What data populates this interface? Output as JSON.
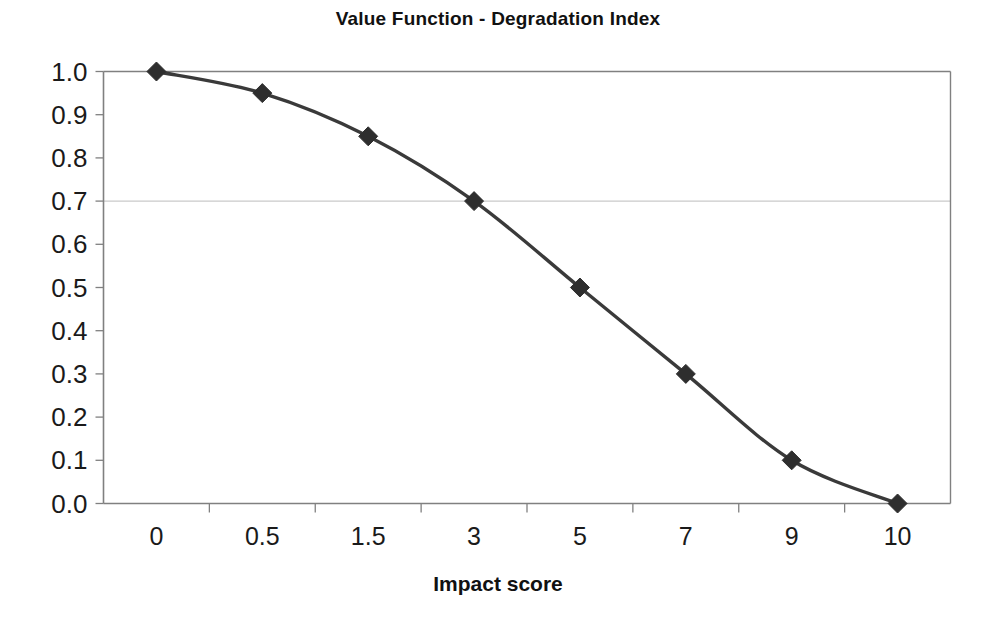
{
  "chart_data": {
    "type": "line",
    "title": "Value Function - Degradation Index",
    "xlabel": "Impact score",
    "ylabel": "",
    "categories": [
      "0",
      "0.5",
      "1.5",
      "3",
      "5",
      "7",
      "9",
      "10"
    ],
    "values": [
      1.0,
      0.95,
      0.85,
      0.7,
      0.5,
      0.3,
      0.1,
      0.0
    ],
    "series": [
      {
        "name": "Degradation Index",
        "values": [
          1.0,
          0.95,
          0.85,
          0.7,
          0.5,
          0.3,
          0.1,
          0.0
        ]
      }
    ],
    "ylim": [
      0.0,
      1.0
    ],
    "ytick_labels": [
      "1.0",
      "0.9",
      "0.8",
      "0.7",
      "0.6",
      "0.5",
      "0.4",
      "0.3",
      "0.2",
      "0.1",
      "0.0"
    ],
    "ytick_values": [
      1.0,
      0.9,
      0.8,
      0.7,
      0.6,
      0.5,
      0.4,
      0.3,
      0.2,
      0.1,
      0.0
    ],
    "grid": {
      "horizontal_gridlines_at": [
        0.7
      ],
      "vertical": false,
      "color": "#b9b9b9"
    },
    "legend": null,
    "marker": "diamond",
    "smoothed": true,
    "colors": {
      "line": "#3a3a3a",
      "marker": "#2e2e2e",
      "axis": "#808080",
      "gridline": "#bdbdbd",
      "text": "#1a1a1a",
      "background": "#ffffff"
    }
  }
}
